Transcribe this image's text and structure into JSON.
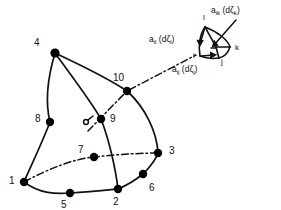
{
  "figure": {
    "type": "finite-element-diagram",
    "stroke_color": "#111111",
    "node_fill_color": "#000000",
    "background_color": "#ffffff"
  },
  "element": {
    "node_count": 10,
    "nodes": [
      {
        "id": "1",
        "label": "1",
        "cx": 24,
        "cy": 182,
        "lx": 9,
        "ly": 176,
        "r": 4.2
      },
      {
        "id": "2",
        "label": "2",
        "cx": 118,
        "cy": 189,
        "lx": 113,
        "ly": 198,
        "r": 4.2
      },
      {
        "id": "3",
        "label": "3",
        "cx": 158,
        "cy": 153,
        "lx": 169,
        "ly": 147,
        "r": 4.2
      },
      {
        "id": "4",
        "label": "4",
        "cx": 55,
        "cy": 53,
        "lx": 35,
        "ly": 39,
        "r": 4.6
      },
      {
        "id": "5",
        "label": "5",
        "cx": 70,
        "cy": 193,
        "lx": 61,
        "ly": 201,
        "r": 4.2
      },
      {
        "id": "6",
        "label": "6",
        "cx": 143,
        "cy": 174,
        "lx": 149,
        "ly": 184,
        "r": 4.2
      },
      {
        "id": "7",
        "label": "7",
        "cx": 94,
        "cy": 157,
        "lx": 78,
        "ly": 147,
        "r": 4.2
      },
      {
        "id": "8",
        "label": "8",
        "cx": 50,
        "cy": 122,
        "lx": 36,
        "ly": 116,
        "r": 4.2
      },
      {
        "id": "9",
        "label": "9",
        "cx": 101,
        "cy": 119,
        "lx": 110,
        "ly": 118,
        "r": 4.2
      },
      {
        "id": "10",
        "label": "10",
        "cx": 127,
        "cy": 91,
        "lx": 115,
        "ly": 76,
        "r": 4.2
      }
    ]
  },
  "inset": {
    "vertices": [
      {
        "id": "l",
        "label": "l",
        "lx": 204,
        "ly": 17
      },
      {
        "id": "k",
        "label": "k",
        "lx": 236,
        "ly": 48
      },
      {
        "id": "j",
        "label": "j",
        "lx": 222,
        "ly": 62
      },
      {
        "id": "i",
        "label": "i",
        "lx": 194,
        "ly": 57
      }
    ],
    "area_labels": [
      {
        "id": "a_ik",
        "a": "a",
        "asub": "ik",
        "d": "(d",
        "zeta": "ζ",
        "zsub": "k",
        "close": ")",
        "lx": 218,
        "ly": 9
      },
      {
        "id": "a_il",
        "a": "a",
        "asub": "il",
        "d": "(d",
        "zeta": "ζ",
        "zsub": "l",
        "close": ")",
        "lx": 152,
        "ly": 38
      },
      {
        "id": "a_ij",
        "a": "a",
        "asub": "ij",
        "d": "(d",
        "zeta": "ζ",
        "zsub": "j",
        "close": ")",
        "lx": 175,
        "ly": 68
      }
    ]
  }
}
